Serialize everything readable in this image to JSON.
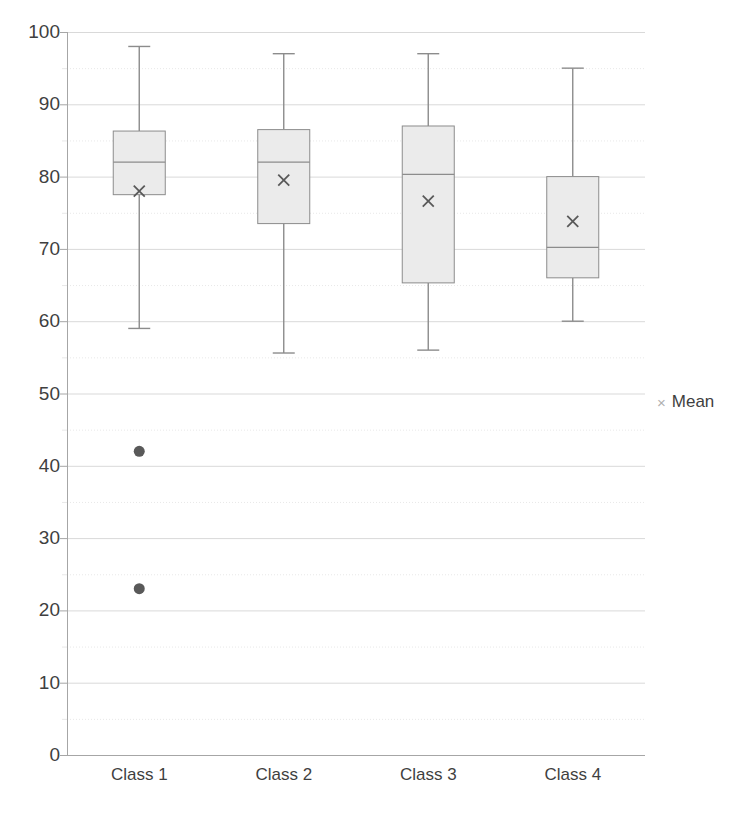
{
  "chart_data": {
    "type": "box",
    "title": "",
    "xlabel": "",
    "ylabel": "",
    "categories": [
      "Class 1",
      "Class 2",
      "Class 3",
      "Class 4"
    ],
    "ylim": [
      0,
      100
    ],
    "y_major_ticks": [
      0,
      10,
      20,
      30,
      40,
      50,
      60,
      70,
      80,
      90,
      100
    ],
    "y_minor_ticks": [
      5,
      15,
      25,
      35,
      45,
      55,
      65,
      75,
      85,
      95
    ],
    "y_tick_labels": [
      "0",
      "10",
      "20",
      "30",
      "40",
      "50",
      "60",
      "70",
      "80",
      "90",
      "100"
    ],
    "grid": true,
    "grid_major_color": "#d9d9d9",
    "grid_minor_color": "#e8e8e8",
    "box_fill_color": "#ebebeb",
    "box_line_color": "#8c8c8c",
    "whisker_color": "#8c8c8c",
    "mean_marker_color": "#595959",
    "outlier_color": "#595959",
    "legend": {
      "position": "right",
      "entries": [
        {
          "label": "Mean",
          "marker": "x",
          "marker_glyph": "×",
          "color": "#b0b0b0"
        }
      ]
    },
    "series": [
      {
        "name": "Class 1",
        "whisker_low": 59.0,
        "q1": 77.5,
        "median": 82.0,
        "q3": 86.3,
        "whisker_high": 98.0,
        "mean": 78.0,
        "outliers": [
          42.0,
          23.0
        ]
      },
      {
        "name": "Class 2",
        "whisker_low": 55.6,
        "q1": 73.5,
        "median": 82.0,
        "q3": 86.5,
        "whisker_high": 97.0,
        "mean": 79.5,
        "outliers": []
      },
      {
        "name": "Class 3",
        "whisker_low": 56.0,
        "q1": 65.3,
        "median": 80.3,
        "q3": 87.0,
        "whisker_high": 97.0,
        "mean": 76.6,
        "outliers": []
      },
      {
        "name": "Class 4",
        "whisker_low": 60.0,
        "q1": 66.0,
        "median": 70.2,
        "q3": 80.0,
        "whisker_high": 95.0,
        "mean": 73.8,
        "outliers": []
      }
    ]
  },
  "legend": {
    "mean_marker": "×",
    "mean_label": "Mean"
  }
}
